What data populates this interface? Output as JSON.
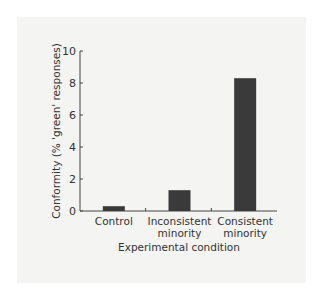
{
  "chart_data": {
    "type": "bar",
    "title": "",
    "xlabel": "Experimental condition",
    "ylabel": "Conformity (% 'green' responses)",
    "categories": [
      "Control",
      "Inconsistent minority",
      "Consistent minority"
    ],
    "category_lines": [
      [
        "Control"
      ],
      [
        "Inconsistent",
        "minority"
      ],
      [
        "Consistent",
        "minority"
      ]
    ],
    "values": [
      0.3,
      1.3,
      8.3
    ],
    "ylim": [
      0,
      10
    ],
    "yticks": [
      0,
      2,
      4,
      6,
      8,
      10
    ],
    "grid": false,
    "legend": null,
    "bar_color": "#3a3a3a"
  }
}
